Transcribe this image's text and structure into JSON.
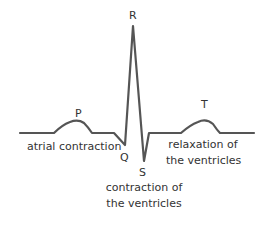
{
  "diagram": {
    "type": "ecg-waveform",
    "stroke_color": "#555555",
    "waves": {
      "P": "P",
      "Q": "Q",
      "R": "R",
      "S": "S",
      "T": "T"
    },
    "annotations": {
      "atrial": "atrial contraction",
      "ventricular_contraction_line1": "contraction of",
      "ventricular_contraction_line2": "the ventricles",
      "ventricular_relaxation_line1": "relaxation of",
      "ventricular_relaxation_line2": "the ventricles"
    }
  }
}
